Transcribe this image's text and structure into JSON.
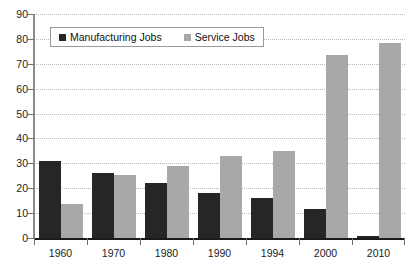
{
  "chart_data": {
    "type": "bar",
    "title": "",
    "subtitle": "",
    "xlabel": "",
    "ylabel": "",
    "categories": [
      "1960",
      "1970",
      "1980",
      "1990",
      "1994",
      "2000",
      "2010"
    ],
    "series": [
      {
        "name": "Manufacturing Jobs",
        "color": "#262626",
        "values": [
          31,
          26,
          22,
          18,
          16,
          11.5,
          1
        ]
      },
      {
        "name": "Service Jobs",
        "color": "#a8a8a8",
        "values": [
          13.5,
          25.5,
          29,
          33,
          35,
          73.5,
          78.5
        ]
      }
    ],
    "ylim": [
      0,
      90
    ],
    "yticks": [
      0,
      10,
      20,
      30,
      40,
      50,
      60,
      70,
      80,
      90
    ],
    "ytick_labels": [
      "0",
      "10",
      "20",
      "30",
      "40",
      "50",
      "60",
      "70",
      "80",
      "90"
    ],
    "grid": true,
    "grid_axis": "y",
    "legend_position": "top-left",
    "annotations": []
  },
  "legend": {
    "entries": [
      {
        "label": "Manufacturing Jobs",
        "swatch": "legend-swatch-manufacturing"
      },
      {
        "label": "Service Jobs",
        "swatch": "legend-swatch-service"
      }
    ]
  }
}
